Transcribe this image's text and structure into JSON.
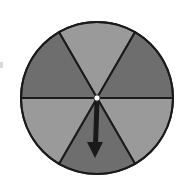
{
  "spinner": {
    "sector_count": 6,
    "center": [
      97,
      98
    ],
    "radius": 76,
    "sectors": [
      {
        "position": "top",
        "shade": "light",
        "color": "#9a9a9a"
      },
      {
        "position": "upper-right",
        "shade": "dark",
        "color": "#6e6e6e"
      },
      {
        "position": "lower-right",
        "shade": "light",
        "color": "#9a9a9a"
      },
      {
        "position": "bottom",
        "shade": "dark",
        "color": "#6e6e6e"
      },
      {
        "position": "lower-left",
        "shade": "light",
        "color": "#9a9a9a"
      },
      {
        "position": "upper-left",
        "shade": "dark",
        "color": "#6e6e6e"
      }
    ],
    "outline_color": "#1a1a1a",
    "pivot_color": "#ffffff",
    "arrow": {
      "direction": "down",
      "points_to_sector": "bottom",
      "color": "#1a1a1a"
    }
  }
}
